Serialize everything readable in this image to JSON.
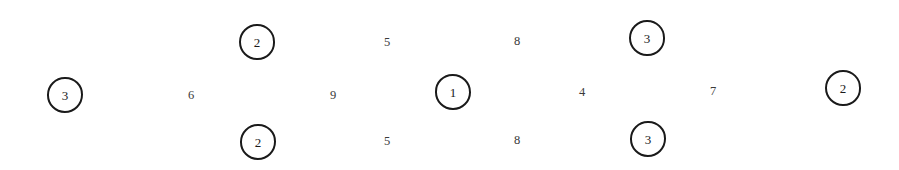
{
  "diagram": {
    "type": "node-scatter",
    "background_color": "#ffffff",
    "stroke_color": "#1a1a1a",
    "plain_text_color": "#3a3a3a",
    "width": 899,
    "height": 170,
    "row_count": 3,
    "node_count": 14,
    "circled_count": 6,
    "plain_count": 8,
    "nodes": [
      {
        "id": "node-1",
        "value": "3",
        "style": "circled",
        "row": "middle",
        "x": 47,
        "y": 77,
        "size": 36
      },
      {
        "id": "node-2",
        "value": "6",
        "style": "plain",
        "row": "middle",
        "x": 183,
        "y": 87,
        "size": 16
      },
      {
        "id": "node-3",
        "value": "2",
        "style": "circled",
        "row": "top",
        "x": 239,
        "y": 24,
        "size": 36
      },
      {
        "id": "node-4",
        "value": "2",
        "style": "circled",
        "row": "bottom",
        "x": 240,
        "y": 124,
        "size": 36
      },
      {
        "id": "node-5",
        "value": "9",
        "style": "plain",
        "row": "middle",
        "x": 325,
        "y": 87,
        "size": 16
      },
      {
        "id": "node-6",
        "value": "5",
        "style": "plain",
        "row": "top",
        "x": 379,
        "y": 34,
        "size": 16
      },
      {
        "id": "node-7",
        "value": "5",
        "style": "plain",
        "row": "bottom",
        "x": 379,
        "y": 133,
        "size": 16
      },
      {
        "id": "node-8",
        "value": "1",
        "style": "circled",
        "row": "middle",
        "x": 435,
        "y": 74,
        "size": 36
      },
      {
        "id": "node-9",
        "value": "8",
        "style": "plain",
        "row": "top",
        "x": 509,
        "y": 33,
        "size": 16
      },
      {
        "id": "node-10",
        "value": "8",
        "style": "plain",
        "row": "bottom",
        "x": 509,
        "y": 132,
        "size": 16
      },
      {
        "id": "node-11",
        "value": "4",
        "style": "plain",
        "row": "middle",
        "x": 574,
        "y": 84,
        "size": 16
      },
      {
        "id": "node-12",
        "value": "3",
        "style": "circled",
        "row": "top",
        "x": 629,
        "y": 20,
        "size": 36
      },
      {
        "id": "node-13",
        "value": "3",
        "style": "circled",
        "row": "bottom",
        "x": 630,
        "y": 121,
        "size": 36
      },
      {
        "id": "node-14",
        "value": "7",
        "style": "plain",
        "row": "middle",
        "x": 705,
        "y": 83,
        "size": 16
      },
      {
        "id": "node-15",
        "value": "2",
        "style": "circled",
        "row": "middle",
        "x": 825,
        "y": 70,
        "size": 36
      }
    ]
  }
}
